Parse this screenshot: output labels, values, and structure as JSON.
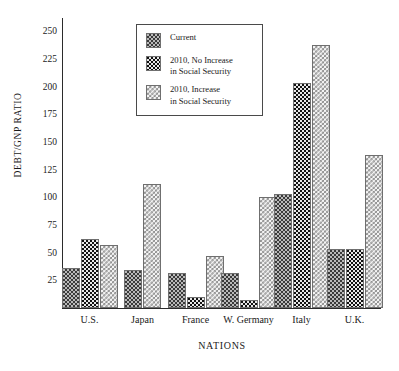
{
  "chart_data": {
    "type": "bar",
    "title": "",
    "xlabel": "NATIONS",
    "ylabel": "DEBT/GNP RATIO",
    "categories": [
      "U.S.",
      "Japan",
      "France",
      "W. Germany",
      "Italy",
      "U.K."
    ],
    "series": [
      {
        "name": "Current",
        "pattern": "pat-current",
        "values": [
          36,
          34,
          32,
          32,
          103,
          53
        ]
      },
      {
        "name": "2010, No Increase in Social Security",
        "pattern": "pat-noinc",
        "values": [
          62,
          null,
          10,
          7,
          203,
          53
        ]
      },
      {
        "name": "2010, Increase in Social Security",
        "pattern": "pat-inc",
        "values": [
          57,
          112,
          47,
          100,
          238,
          138
        ]
      }
    ],
    "ylim": [
      0,
      262
    ],
    "yticks": [
      25,
      50,
      75,
      100,
      125,
      150,
      175,
      200,
      225,
      250
    ],
    "grid": false,
    "legend_position": "top-center"
  },
  "legend": {
    "entries": [
      {
        "label": "Current"
      },
      {
        "label": "2010, No Increase\nin Social Security"
      },
      {
        "label": "2010, Increase\nin Social Security"
      }
    ]
  },
  "colors": {
    "axis": "#2b2b2b",
    "text": "#1a1a1a",
    "current": "#b9b9b9",
    "no_increase": "#111111",
    "increase": "#f4f4f4",
    "background": "#ffffff"
  }
}
